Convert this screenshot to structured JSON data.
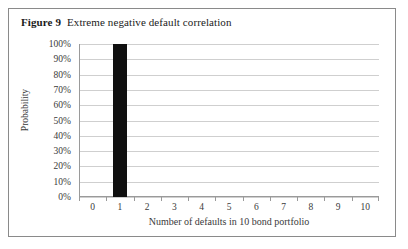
{
  "figure": {
    "label": "Figure 9",
    "caption": "Extreme negative default correlation"
  },
  "chart_data": {
    "type": "bar",
    "title": "Extreme negative default correlation",
    "xlabel": "Number of defaults in 10 bond portfolio",
    "ylabel": "Probability",
    "categories": [
      "0",
      "1",
      "2",
      "3",
      "4",
      "5",
      "6",
      "7",
      "8",
      "9",
      "10"
    ],
    "values": [
      0,
      100,
      0,
      0,
      0,
      0,
      0,
      0,
      0,
      0,
      0
    ],
    "value_unit": "%",
    "ytick_labels": [
      "0%",
      "10%",
      "20%",
      "30%",
      "40%",
      "50%",
      "60%",
      "70%",
      "80%",
      "90%",
      "100%"
    ],
    "ytick_values": [
      0,
      10,
      20,
      30,
      40,
      50,
      60,
      70,
      80,
      90,
      100
    ],
    "ylim": [
      0,
      100
    ],
    "grid": true,
    "legend": false,
    "bar_color": "#101010",
    "gridline_color": "#cfcfcf",
    "axis_color": "#9a9a9a",
    "background_color": "#ffffff"
  }
}
